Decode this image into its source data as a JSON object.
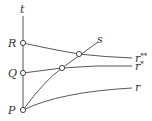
{
  "diagram": {
    "axis_label": "t",
    "points": [
      {
        "label": "R"
      },
      {
        "label": "Q"
      },
      {
        "label": "P"
      }
    ],
    "curves": [
      {
        "label": "s"
      },
      {
        "label": "r",
        "sup": "**"
      },
      {
        "label": "r",
        "sup": "*"
      },
      {
        "label": "r"
      }
    ]
  }
}
